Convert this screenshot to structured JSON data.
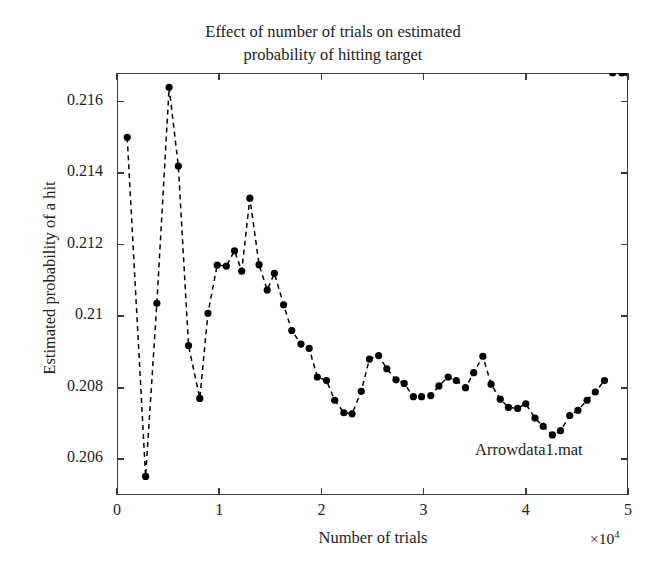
{
  "chart_data": {
    "type": "line",
    "title": "Effect of number of trials on estimated probability of hitting target",
    "title_line1": "Effect of number of trials on estimated",
    "title_line2": "probability of hitting target",
    "xlabel": "Number of trials",
    "ylabel": "Estimated probability of a hit",
    "x_multiplier": "×10",
    "x_multiplier_exponent": "4",
    "annotation": "Arrowdata1.mat",
    "grid": false,
    "legend": null,
    "marker": "filled-circle",
    "linestyle": "dashed",
    "color": "#000000",
    "xlim": [
      0,
      50000
    ],
    "ylim": [
      0.205,
      0.2168
    ],
    "xticks": [
      0,
      10000,
      20000,
      30000,
      40000,
      50000
    ],
    "xtick_labels": [
      "0",
      "1",
      "2",
      "3",
      "4",
      "5"
    ],
    "yticks": [
      0.206,
      0.208,
      0.21,
      0.212,
      0.214,
      0.216
    ],
    "ytick_labels": [
      "0.206",
      "0.208",
      "0.21",
      "0.212",
      "0.214",
      "0.216"
    ],
    "x": [
      1000,
      2800,
      3900,
      5100,
      6000,
      7000,
      8100,
      8900,
      9800,
      10700,
      11500,
      12200,
      13000,
      13900,
      14700,
      15400,
      16300,
      17100,
      18000,
      18800,
      19600,
      20500,
      21300,
      22200,
      23000,
      23900,
      24700,
      25600,
      26400,
      27300,
      28100,
      29000,
      29800,
      30700,
      31500,
      32400,
      33200,
      34100,
      34900,
      35800,
      36600,
      37500,
      38300,
      39200,
      40000,
      40900,
      41700,
      42600,
      43400,
      44300,
      45100,
      46000,
      46800,
      47700,
      48500,
      49400,
      50000
    ],
    "y": [
      0.215,
      0.20552,
      0.21036,
      0.2164,
      0.2142,
      0.20918,
      0.2077,
      0.21008,
      0.21143,
      0.2114,
      0.21183,
      0.21126,
      0.2133,
      0.21144,
      0.21073,
      0.2112,
      0.21032,
      0.2096,
      0.20922,
      0.2091,
      0.2083,
      0.2082,
      0.20765,
      0.2073,
      0.20727,
      0.2079,
      0.2088,
      0.2089,
      0.20853,
      0.20822,
      0.20812,
      0.20775,
      0.20775,
      0.20778,
      0.20805,
      0.2083,
      0.2082,
      0.208,
      0.20842,
      0.20888,
      0.2081,
      0.20768,
      0.20745,
      0.20742,
      0.20755,
      0.20715,
      0.20692,
      0.20668,
      0.2068,
      0.20722,
      0.20737,
      0.20765,
      0.20788,
      0.2082
    ]
  }
}
